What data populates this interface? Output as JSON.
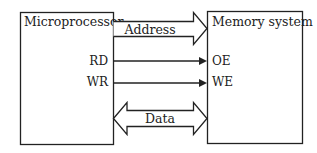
{
  "diagram": {
    "blocks": [
      {
        "id": "microprocessor",
        "label": "Microprocessor"
      },
      {
        "id": "memory",
        "label": "Memory system"
      }
    ],
    "signals": {
      "address": {
        "label": "Address",
        "type": "bus",
        "direction": "microprocessor-to-memory"
      },
      "rd": {
        "label": "RD",
        "target_label": "OE",
        "type": "line",
        "direction": "microprocessor-to-memory"
      },
      "wr": {
        "label": "WR",
        "target_label": "WE",
        "type": "line",
        "direction": "microprocessor-to-memory"
      },
      "data": {
        "label": "Data",
        "type": "bus",
        "direction": "bidirectional"
      }
    },
    "colors": {
      "stroke": "#222222",
      "fill": "#ffffff"
    }
  }
}
